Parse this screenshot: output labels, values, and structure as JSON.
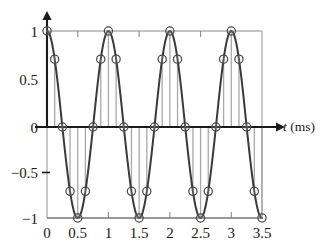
{
  "chart_data": {
    "type": "line",
    "title": "",
    "subtitle": "",
    "xlabel_var": "t",
    "xlabel_unit": "(ms)",
    "ylabel": "",
    "xlim": [
      0,
      3.5
    ],
    "ylim": [
      -1,
      1
    ],
    "grid": false,
    "legend": null,
    "annotations": [],
    "x_ticks": [
      0,
      0.5,
      1,
      1.5,
      2,
      2.5,
      3,
      3.5
    ],
    "x_tick_labels": [
      "0",
      "0.5",
      "1",
      "1.5",
      "2",
      "2.5",
      "3",
      "3.5"
    ],
    "y_ticks": [
      -1,
      -0.5,
      0,
      0.5,
      1
    ],
    "y_tick_labels": [
      "−1",
      "−0.5",
      "0",
      "0.5",
      "1"
    ],
    "sample_period": 0.125,
    "waveform": "cosine",
    "period_ms": 1,
    "series": [
      {
        "name": "samples",
        "marker": "open-circle",
        "stem": true,
        "x": [
          0,
          0.125,
          0.25,
          0.375,
          0.5,
          0.625,
          0.75,
          0.875,
          1,
          1.125,
          1.25,
          1.375,
          1.5,
          1.625,
          1.75,
          1.875,
          2,
          2.125,
          2.25,
          2.375,
          2.5,
          2.625,
          2.75,
          2.875,
          3,
          3.125,
          3.25,
          3.375,
          3.5
        ],
        "values": [
          1,
          0.707,
          0,
          -0.707,
          -1,
          -0.707,
          0,
          0.707,
          1,
          0.707,
          0,
          -0.707,
          -1,
          -0.707,
          0,
          0.707,
          1,
          0.707,
          0,
          -0.707,
          -1,
          -0.707,
          0,
          0.707,
          1,
          0.707,
          0,
          -0.707,
          -1
        ]
      },
      {
        "name": "continuous-cosine",
        "marker": "none",
        "stem": false,
        "expression": "cos(2*pi*t)"
      }
    ]
  },
  "colors": {
    "curve": "#3a3a3a",
    "stem": "#a8a8a8",
    "marker_stroke": "#4a4a4a",
    "axis": "#1a1a1a",
    "frame": "#b0b0b0",
    "background": "#ffffff"
  },
  "axis_label": {
    "variable": "t",
    "unit": "(ms)"
  }
}
